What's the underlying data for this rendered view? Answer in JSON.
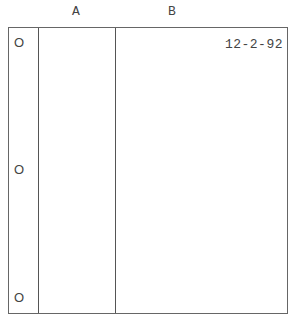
{
  "columns": [
    {
      "label": "A"
    },
    {
      "label": "B"
    }
  ],
  "holes": [
    {
      "label": "O"
    },
    {
      "label": "O"
    },
    {
      "label": "O"
    }
  ],
  "entry": {
    "date": "12-2-92"
  }
}
